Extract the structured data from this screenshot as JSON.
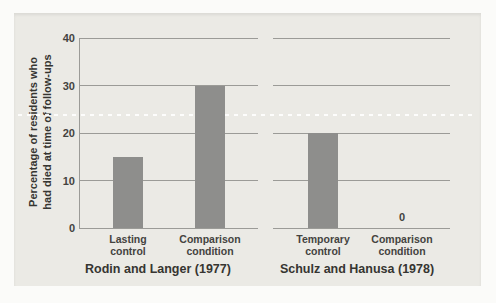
{
  "figure": {
    "colors": {
      "page_bg": "#fbfbf9",
      "figure_bg": "#ebeae5",
      "bar": "#8e8e8c",
      "grid": "#9b9b97",
      "reference_line": "#ffffff",
      "text": "#44433f",
      "title_text": "#363531"
    }
  },
  "chart_data": {
    "type": "bar",
    "ylabel_lines": [
      "Percentage of residents who",
      "had died at time of follow-ups"
    ],
    "ylim": [
      0,
      40
    ],
    "yticks": [
      0,
      10,
      20,
      30,
      40
    ],
    "grid": true,
    "legend": "none",
    "reference_line": {
      "style": "dashed-white",
      "value": 24
    },
    "panels": [
      {
        "title": "Rodin and Langer (1977)",
        "categories": [
          [
            "Lasting",
            "control"
          ],
          [
            "Comparison",
            "condition"
          ]
        ],
        "values": [
          15,
          30
        ]
      },
      {
        "title": "Schulz and Hanusa (1978)",
        "categories": [
          [
            "Temporary",
            "control"
          ],
          [
            "Comparison",
            "condition"
          ]
        ],
        "values": [
          20,
          0
        ]
      }
    ]
  }
}
